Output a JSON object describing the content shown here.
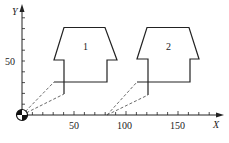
{
  "figure": {
    "x_axis_label": "X",
    "y_axis_label": "Y",
    "x_ticks": [
      {
        "value": 50,
        "label": "50"
      },
      {
        "value": 100,
        "label": "100"
      },
      {
        "value": 150,
        "label": "150"
      }
    ],
    "y_ticks": [
      {
        "value": 50,
        "label": "50"
      }
    ],
    "shapes": [
      {
        "id": "shape-1",
        "label": "1"
      },
      {
        "id": "shape-2",
        "label": "2"
      }
    ],
    "colors": {
      "stroke": "#222222",
      "background": "#ffffff"
    }
  }
}
